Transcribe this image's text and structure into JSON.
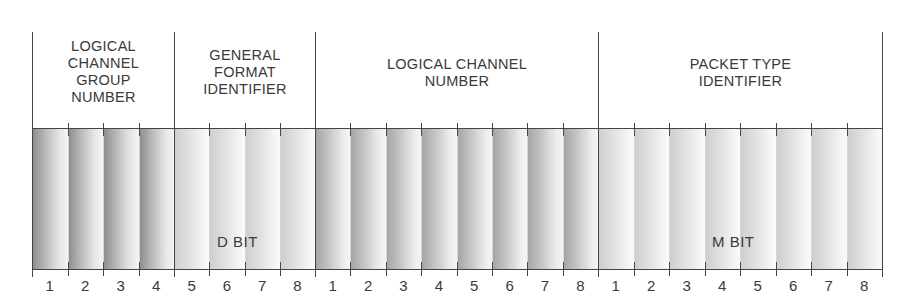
{
  "diagram": {
    "fields": [
      {
        "label": "LOGICAL\nCHANNEL\nGROUP\nNUMBER",
        "bits": [
          "1",
          "2",
          "3",
          "4"
        ],
        "shade": "dark"
      },
      {
        "label": "GENERAL\nFORMAT\nIDENTIFIER",
        "bits": [
          "5",
          "6",
          "7",
          "8"
        ],
        "shade": "light"
      },
      {
        "label": "LOGICAL  CHANNEL\nNUMBER",
        "bits": [
          "1",
          "2",
          "3",
          "4",
          "5",
          "6",
          "7",
          "8"
        ],
        "shade": "med"
      },
      {
        "label": "PACKET  TYPE\nIDENTIFIER",
        "bits": [
          "1",
          "2",
          "3",
          "4",
          "5",
          "6",
          "7",
          "8"
        ],
        "shade": "light"
      }
    ],
    "annotations": {
      "d_bit": "D  BIT",
      "m_bit": "M  BIT"
    }
  }
}
